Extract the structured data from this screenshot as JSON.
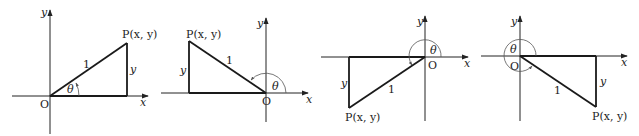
{
  "diagrams": [
    {
      "quadrant": 1,
      "origin_label": "O",
      "x_axis_label": "x",
      "y_axis_label": "y",
      "point_label": "P(x, y)",
      "hypotenuse_label": "1",
      "side_label": "y",
      "angle_label": "θ"
    },
    {
      "quadrant": 2,
      "origin_label": "O",
      "x_axis_label": "x",
      "y_axis_label": "y",
      "point_label": "P(x, y)",
      "hypotenuse_label": "1",
      "side_label": "y",
      "angle_label": "θ"
    },
    {
      "quadrant": 3,
      "origin_label": "O",
      "x_axis_label": "x",
      "y_axis_label": "y",
      "point_label": "P(x, y)",
      "hypotenuse_label": "1",
      "side_label": "y",
      "angle_label": "θ"
    },
    {
      "quadrant": 4,
      "origin_label": "O",
      "x_axis_label": "x",
      "y_axis_label": "y",
      "point_label": "P(x, y)",
      "hypotenuse_label": "1",
      "side_label": "y",
      "angle_label": "θ"
    }
  ],
  "colors": {
    "line": "#1a1a1a",
    "arc": "#555555",
    "background": "#ffffff"
  }
}
